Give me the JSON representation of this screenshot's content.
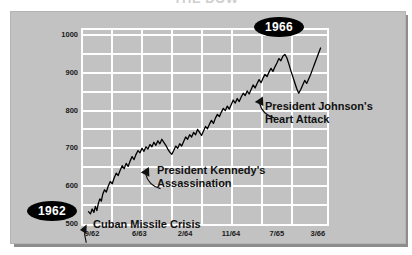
{
  "title": "THE DOW",
  "panel": {
    "background_color": "#c2c2c2",
    "grid_color": "#ffffff",
    "line_color": "#000000"
  },
  "badges": [
    {
      "name": "badge-1962",
      "label": "1962"
    },
    {
      "name": "badge-1966",
      "label": "1966"
    }
  ],
  "annotations": [
    {
      "name": "cuban-missile-crisis",
      "label": "Cuban Missile Crisis"
    },
    {
      "name": "kennedy-assassination",
      "line1": "President Kennedy's",
      "line2": "Assassination"
    },
    {
      "name": "johnson-heart-attack",
      "line1": "President Johnson's",
      "line2": "Heart Attack"
    }
  ],
  "chart_data": {
    "type": "line",
    "title": "THE DOW",
    "xlabel": "",
    "ylabel": "",
    "ylim": [
      500,
      1025
    ],
    "yticks": [
      500,
      600,
      700,
      800,
      900,
      1000
    ],
    "ytick_labels": [
      "500",
      "600",
      "700",
      "800",
      "900",
      "1000"
    ],
    "y_minor_step": 50,
    "xtick_labels": [
      "9/62",
      "6/63",
      "2/64",
      "11/64",
      "7/65",
      "3/66"
    ],
    "xtick_positions": [
      0.045,
      0.235,
      0.42,
      0.605,
      0.79,
      0.955
    ],
    "grid": true,
    "legend": null,
    "series": [
      {
        "name": "Dow Jones Industrial Average",
        "color": "#000000",
        "x": [
          0.03,
          0.038,
          0.045,
          0.052,
          0.058,
          0.064,
          0.07,
          0.076,
          0.082,
          0.088,
          0.095,
          0.102,
          0.11,
          0.118,
          0.126,
          0.134,
          0.142,
          0.15,
          0.158,
          0.166,
          0.174,
          0.182,
          0.19,
          0.198,
          0.206,
          0.214,
          0.222,
          0.23,
          0.238,
          0.246,
          0.254,
          0.262,
          0.27,
          0.278,
          0.286,
          0.294,
          0.302,
          0.31,
          0.318,
          0.326,
          0.334,
          0.342,
          0.35,
          0.358,
          0.366,
          0.374,
          0.382,
          0.39,
          0.398,
          0.406,
          0.414,
          0.422,
          0.43,
          0.438,
          0.446,
          0.454,
          0.462,
          0.47,
          0.478,
          0.486,
          0.494,
          0.502,
          0.51,
          0.518,
          0.526,
          0.534,
          0.542,
          0.55,
          0.558,
          0.566,
          0.574,
          0.582,
          0.59,
          0.598,
          0.606,
          0.614,
          0.622,
          0.63,
          0.638,
          0.646,
          0.654,
          0.662,
          0.67,
          0.678,
          0.686,
          0.694,
          0.702,
          0.71,
          0.718,
          0.726,
          0.734,
          0.742,
          0.75,
          0.758,
          0.766,
          0.774,
          0.782,
          0.79,
          0.798,
          0.806,
          0.814,
          0.822,
          0.83,
          0.838,
          0.846,
          0.854,
          0.862,
          0.87,
          0.878,
          0.886,
          0.894,
          0.902,
          0.91,
          0.918,
          0.926,
          0.934,
          0.942,
          0.95,
          0.958,
          0.966
        ],
        "y": [
          538,
          532,
          545,
          536,
          552,
          541,
          560,
          572,
          566,
          585,
          596,
          590,
          606,
          618,
          612,
          628,
          640,
          634,
          648,
          660,
          652,
          666,
          658,
          672,
          684,
          676,
          690,
          700,
          694,
          706,
          698,
          710,
          704,
          716,
          710,
          722,
          714,
          726,
          718,
          730,
          722,
          714,
          704,
          696,
          690,
          700,
          712,
          706,
          718,
          712,
          724,
          736,
          730,
          742,
          736,
          748,
          742,
          756,
          748,
          740,
          752,
          764,
          758,
          770,
          780,
          772,
          786,
          796,
          790,
          802,
          812,
          806,
          818,
          810,
          822,
          834,
          826,
          838,
          830,
          842,
          852,
          846,
          858,
          850,
          862,
          874,
          866,
          878,
          888,
          880,
          892,
          902,
          896,
          908,
          918,
          910,
          922,
          932,
          944,
          938,
          950,
          955,
          946,
          930,
          912,
          896,
          880,
          864,
          852,
          862,
          874,
          886,
          878,
          890,
          902,
          916,
          930,
          944,
          958,
          972
        ],
        "final_value": 1000
      }
    ],
    "events": [
      {
        "label": "Cuban Missile Crisis",
        "x_fraction": 0.045,
        "approx_value": 535
      },
      {
        "label": "President Kennedy's Assassination",
        "x_fraction": 0.414,
        "approx_value": 712
      },
      {
        "label": "President Johnson's Heart Attack",
        "x_fraction": 0.854,
        "approx_value": 880
      }
    ]
  }
}
